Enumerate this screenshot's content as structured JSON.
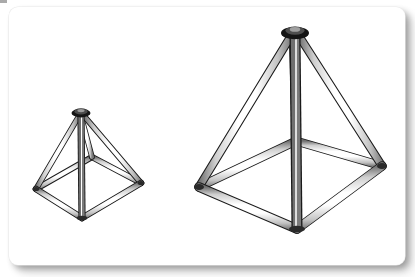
{
  "figure": {
    "title": "",
    "caption": "",
    "background_color": "#ffffff",
    "frame": {
      "type": "rounded-card",
      "fill": "#ffffff",
      "border_color": "#e9e9e9",
      "shadow_color": "#888888",
      "corner_radius_px": 9
    },
    "object_type": "wireframe square-based pyramid (tubular frame)",
    "object_count": 2,
    "view": "isometric / three-quarter perspective",
    "line_color": "#1a1a1a",
    "tube_fill_light": "#ffffff",
    "tube_fill_shade": "#c9c9c9",
    "joint_color": "#161616"
  },
  "objects": [
    {
      "name": "small-pyramid",
      "label": "small tubular pyramid",
      "size": "small",
      "scale_relative": 0.58,
      "tube_width_px": 5,
      "vertices": {
        "apex": {
          "x": 81,
          "y": 114
        },
        "base_left": {
          "x": 36,
          "y": 189
        },
        "base_front": {
          "x": 82,
          "y": 218
        },
        "base_right": {
          "x": 141,
          "y": 183
        },
        "base_back": {
          "x": 92,
          "y": 157
        }
      },
      "members": [
        "apex-to-base_left",
        "apex-to-base_front",
        "apex-to-base_right",
        "apex-to-base_back",
        "base_left-to-base_front",
        "base_front-to-base_right",
        "base_right-to-base_back",
        "base_back-to-base_left",
        "apex-to-base_front (central post)"
      ]
    },
    {
      "name": "large-pyramid",
      "label": "large tubular pyramid",
      "size": "large",
      "scale_relative": 1.0,
      "tube_width_px": 8,
      "vertices": {
        "apex": {
          "x": 295,
          "y": 32
        },
        "base_left": {
          "x": 199,
          "y": 187
        },
        "base_front": {
          "x": 297,
          "y": 229
        },
        "base_right": {
          "x": 382,
          "y": 166
        },
        "base_back": {
          "x": 296,
          "y": 141
        }
      },
      "members": [
        "apex-to-base_left",
        "apex-to-base_front",
        "apex-to-base_right",
        "apex-to-base_back",
        "base_left-to-base_front",
        "base_front-to-base_right",
        "base_right-to-base_back",
        "base_back-to-base_left",
        "apex-to-base_front (central post)"
      ]
    }
  ],
  "chart_data": {
    "type": "diagram",
    "items": [
      {
        "name": "small-pyramid",
        "edges": 9,
        "base_sides": 4
      },
      {
        "name": "large-pyramid",
        "edges": 9,
        "base_sides": 4
      }
    ]
  }
}
